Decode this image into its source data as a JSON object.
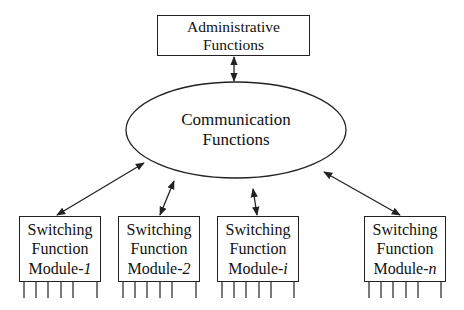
{
  "diagram": {
    "type": "block-diagram",
    "nodes": {
      "admin": {
        "line1": "Administrative",
        "line2": "Functions"
      },
      "comm": {
        "line1": "Communication",
        "line2": "Functions"
      },
      "modules": [
        {
          "line1": "Switching",
          "line2": "Function",
          "prefix": "Module-",
          "index": "1"
        },
        {
          "line1": "Switching",
          "line2": "Function",
          "prefix": "Module-",
          "index": "2"
        },
        {
          "line1": "Switching",
          "line2": "Function",
          "prefix": "Module-",
          "index": "i"
        },
        {
          "line1": "Switching",
          "line2": "Function",
          "prefix": "Module-",
          "index": "n"
        }
      ]
    },
    "edges": [
      {
        "from": "Administrative Functions",
        "to": "Communication Functions",
        "style": "bidirectional-arrow"
      },
      {
        "from": "Communication Functions",
        "to": "Switching Function Module-1",
        "style": "bidirectional-arrow"
      },
      {
        "from": "Communication Functions",
        "to": "Switching Function Module-2",
        "style": "bidirectional-arrow"
      },
      {
        "from": "Communication Functions",
        "to": "Switching Function Module-i",
        "style": "bidirectional-arrow"
      },
      {
        "from": "Communication Functions",
        "to": "Switching Function Module-n",
        "style": "bidirectional-arrow"
      }
    ],
    "colors": {
      "line": "#222222",
      "background": "#ffffff"
    }
  }
}
